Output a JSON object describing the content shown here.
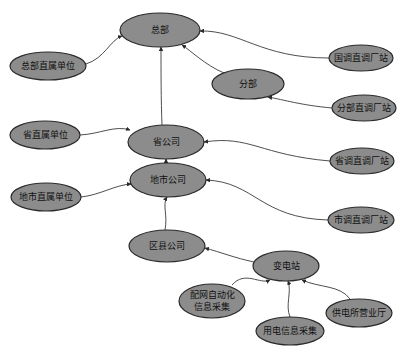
{
  "diagram": {
    "type": "hierarchy-graph",
    "node_fill": "#8c8c8c",
    "node_stroke": "#2a2a2a",
    "edge_color": "#3a3a3a",
    "nodes": [
      {
        "id": "hq",
        "label": "总部",
        "cx": 160,
        "cy": 30,
        "rx": 40,
        "ry": 17
      },
      {
        "id": "hq_direct",
        "label": "总部直属单位",
        "cx": 48,
        "cy": 66,
        "rx": 38,
        "ry": 14
      },
      {
        "id": "national_plants",
        "label": "国调直调厂站",
        "cx": 361,
        "cy": 58,
        "rx": 32,
        "ry": 13
      },
      {
        "id": "branch",
        "label": "分部",
        "cx": 248,
        "cy": 84,
        "rx": 36,
        "ry": 15
      },
      {
        "id": "branch_plants",
        "label": "分部直调厂站",
        "cx": 364,
        "cy": 108,
        "rx": 32,
        "ry": 13
      },
      {
        "id": "province",
        "label": "省公司",
        "cx": 166,
        "cy": 142,
        "rx": 38,
        "ry": 17
      },
      {
        "id": "province_direct",
        "label": "省直属单位",
        "cx": 45,
        "cy": 135,
        "rx": 35,
        "ry": 14
      },
      {
        "id": "province_plants",
        "label": "省调直调厂站",
        "cx": 362,
        "cy": 161,
        "rx": 32,
        "ry": 13
      },
      {
        "id": "city",
        "label": "地市公司",
        "cx": 168,
        "cy": 180,
        "rx": 38,
        "ry": 17
      },
      {
        "id": "city_direct",
        "label": "地市直属单位",
        "cx": 46,
        "cy": 197,
        "rx": 35,
        "ry": 14
      },
      {
        "id": "city_plants",
        "label": "市调直调厂站",
        "cx": 361,
        "cy": 220,
        "rx": 33,
        "ry": 13
      },
      {
        "id": "county",
        "label": "区县公司",
        "cx": 167,
        "cy": 246,
        "rx": 38,
        "ry": 16
      },
      {
        "id": "substation",
        "label": "变电站",
        "cx": 286,
        "cy": 266,
        "rx": 33,
        "ry": 15
      },
      {
        "id": "dist_auto",
        "label": "配网自动化",
        "label2": "信息采集",
        "cx": 212,
        "cy": 301,
        "rx": 33,
        "ry": 17
      },
      {
        "id": "usage_collect",
        "label": "用电信息采集",
        "cx": 290,
        "cy": 331,
        "rx": 34,
        "ry": 14
      },
      {
        "id": "service_hall",
        "label": "供电所营业厅",
        "cx": 359,
        "cy": 313,
        "rx": 33,
        "ry": 14
      }
    ],
    "edges": [
      {
        "from": "hq_direct",
        "to": "hq",
        "d": "M86,64 C105,58 110,40 122,36"
      },
      {
        "from": "national_plants",
        "to": "hq",
        "d": "M329,58 C260,58 240,30 200,31"
      },
      {
        "from": "branch",
        "to": "hq",
        "d": "M224,73 C205,65 190,50 182,45"
      },
      {
        "from": "province",
        "to": "hq",
        "d": "M162,125 C161,100 161,70 161,47"
      },
      {
        "from": "branch_plants",
        "to": "branch",
        "d": "M332,108 C300,105 285,100 268,97"
      },
      {
        "from": "province_direct",
        "to": "province",
        "d": "M80,135 C100,134 115,125 130,130"
      },
      {
        "from": "province_plants",
        "to": "province",
        "d": "M330,161 C260,155 250,135 204,142"
      },
      {
        "from": "city",
        "to": "province",
        "d": "M166,163 C166,150 166,162 166,159"
      },
      {
        "from": "city_direct",
        "to": "city",
        "d": "M81,197 C100,195 115,185 131,184"
      },
      {
        "from": "city_plants",
        "to": "city",
        "d": "M328,220 C260,218 255,182 206,180"
      },
      {
        "from": "county",
        "to": "city",
        "d": "M165,230 C168,215 162,205 167,197"
      },
      {
        "from": "substation",
        "to": "county",
        "d": "M254,262 C235,258 220,252 205,248"
      },
      {
        "from": "dist_auto",
        "to": "substation",
        "d": "M232,285 C245,270 260,285 270,280"
      },
      {
        "from": "usage_collect",
        "to": "substation",
        "d": "M290,317 C285,305 292,292 288,281"
      },
      {
        "from": "service_hall",
        "to": "substation",
        "d": "M350,299 C340,285 320,288 302,280"
      }
    ]
  }
}
